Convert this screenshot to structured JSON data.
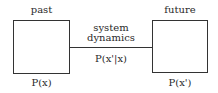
{
  "diagram": {
    "left_box": {
      "title": "past",
      "caption": "P(x)"
    },
    "right_box": {
      "title": "future",
      "caption": "P(x')"
    },
    "connector": {
      "label_line1": "system",
      "label_line2": "dynamics",
      "formula": "P(x'|x)"
    }
  }
}
